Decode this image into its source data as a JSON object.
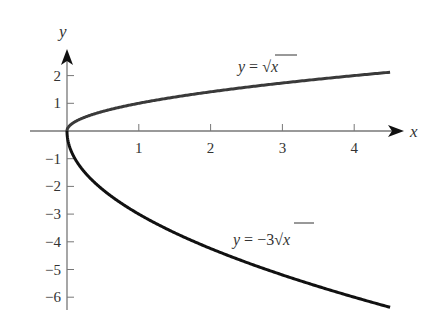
{
  "chart_data": {
    "type": "line",
    "title": "",
    "xlabel": "x",
    "ylabel": "y",
    "xlim": [
      -0.5,
      4.6
    ],
    "ylim": [
      -6.5,
      2.8
    ],
    "grid": false,
    "legend": "none (inline curve labels)",
    "x_ticks": [
      1,
      2,
      3,
      4
    ],
    "y_ticks": [
      2,
      1,
      -1,
      -2,
      -3,
      -4,
      -5,
      -6
    ],
    "x_tick_labels": [
      "1",
      "2",
      "3",
      "4"
    ],
    "y_tick_labels": [
      "2",
      "1",
      "−1",
      "−2",
      "−3",
      "−4",
      "−5",
      "−6"
    ],
    "series": [
      {
        "name": "y = √x",
        "label_parts": [
          "y",
          " = √",
          "x"
        ],
        "function": "sqrt(x)",
        "x": [
          0,
          0.25,
          0.5,
          1,
          1.5,
          2,
          2.5,
          3,
          3.5,
          4,
          4.5
        ],
        "values": [
          0,
          0.5,
          0.707,
          1,
          1.225,
          1.414,
          1.581,
          1.732,
          1.871,
          2,
          2.121
        ],
        "color": "#3a3a3a"
      },
      {
        "name": "y = −3√x",
        "label_parts": [
          "y",
          " = −3√",
          "x"
        ],
        "function": "-3*sqrt(x)",
        "x": [
          0,
          0.25,
          0.5,
          1,
          1.5,
          2,
          2.5,
          3,
          3.5,
          4,
          4.5
        ],
        "values": [
          0,
          -1.5,
          -2.121,
          -3,
          -3.674,
          -4.243,
          -4.743,
          -5.196,
          -5.612,
          -6,
          -6.364
        ],
        "color": "#111111"
      }
    ],
    "annotations": [
      {
        "text": "y = √x",
        "x": 2.5,
        "y": 2.3
      },
      {
        "text": "y = −3√x",
        "x": 2.4,
        "y": -4.2
      }
    ]
  }
}
